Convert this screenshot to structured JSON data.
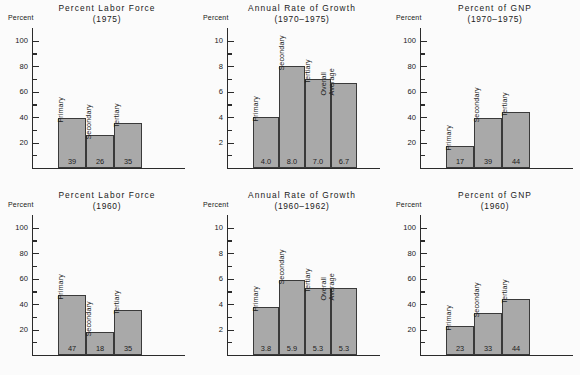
{
  "figure": {
    "background_color": "#fbfbfb",
    "bar_fill_color": "#a9a9a9",
    "bar_border_color": "#3a3a3a",
    "axis_color": "#2b2b2b"
  },
  "panels": [
    {
      "id": "labor-force-1975",
      "title": "Percent Labor Force",
      "subtitle": "(1975)",
      "axis_name": "Percent"
    },
    {
      "id": "growth-1970-1975",
      "title": "Annual Rate of Growth",
      "subtitle": "(1970–1975)",
      "axis_name": "Percent"
    },
    {
      "id": "gnp-1970-1975",
      "title": "Percent of GNP",
      "subtitle": "(1970–1975)",
      "axis_name": "Percent"
    },
    {
      "id": "labor-force-1960",
      "title": "Percent Labor Force",
      "subtitle": "(1960)",
      "axis_name": "Percent"
    },
    {
      "id": "growth-1960-1962",
      "title": "Annual Rate of Growth",
      "subtitle": "(1960–1962)",
      "axis_name": "Percent"
    },
    {
      "id": "gnp-1960",
      "title": "Percent of GNP",
      "subtitle": "(1960)",
      "axis_name": "Percent"
    }
  ],
  "chart_data": [
    {
      "type": "bar",
      "title": "Percent Labor Force",
      "subtitle": "(1975)",
      "xlabel": "",
      "ylabel": "Percent",
      "ylim": [
        0,
        110
      ],
      "yticks": [
        20,
        40,
        60,
        80,
        100
      ],
      "minor_yticks": [
        10,
        30,
        50,
        70,
        90
      ],
      "grid": false,
      "categories": [
        "Primary",
        "Secondary",
        "Tertiary"
      ],
      "values": [
        39,
        26,
        35
      ],
      "value_labels": [
        "39",
        "26",
        "35"
      ]
    },
    {
      "type": "bar",
      "title": "Annual Rate of Growth",
      "subtitle": "(1970–1975)",
      "xlabel": "",
      "ylabel": "Percent",
      "ylim": [
        0,
        11
      ],
      "yticks": [
        2,
        4,
        6,
        8,
        10
      ],
      "minor_yticks": [
        1,
        3,
        5,
        7,
        9
      ],
      "grid": false,
      "categories": [
        "Primary",
        "Secondary",
        "Tertiary",
        "Overall Average"
      ],
      "values": [
        4.0,
        8.0,
        7.0,
        6.7
      ],
      "value_labels": [
        "4.0",
        "8.0",
        "7.0",
        "6.7"
      ]
    },
    {
      "type": "bar",
      "title": "Percent of GNP",
      "subtitle": "(1970–1975)",
      "xlabel": "",
      "ylabel": "Percent",
      "ylim": [
        0,
        110
      ],
      "yticks": [
        20,
        40,
        60,
        80,
        100
      ],
      "minor_yticks": [
        10,
        30,
        50,
        70,
        90
      ],
      "grid": false,
      "categories": [
        "Primary",
        "Secondary",
        "Tertiary"
      ],
      "values": [
        17,
        39,
        44
      ],
      "value_labels": [
        "17",
        "39",
        "44"
      ]
    },
    {
      "type": "bar",
      "title": "Percent Labor Force",
      "subtitle": "(1960)",
      "xlabel": "",
      "ylabel": "Percent",
      "ylim": [
        0,
        110
      ],
      "yticks": [
        20,
        40,
        60,
        80,
        100
      ],
      "minor_yticks": [
        10,
        30,
        50,
        70,
        90
      ],
      "grid": false,
      "categories": [
        "Primary",
        "Secondary",
        "Tertiary"
      ],
      "values": [
        47,
        18,
        35
      ],
      "value_labels": [
        "47",
        "18",
        "35"
      ]
    },
    {
      "type": "bar",
      "title": "Annual Rate of Growth",
      "subtitle": "(1960–1962)",
      "xlabel": "",
      "ylabel": "Percent",
      "ylim": [
        0,
        11
      ],
      "yticks": [
        2,
        4,
        6,
        8,
        10
      ],
      "minor_yticks": [
        1,
        3,
        5,
        7,
        9
      ],
      "grid": false,
      "categories": [
        "Primary",
        "Secondary",
        "Tertiary",
        "Overall Average"
      ],
      "values": [
        3.8,
        5.9,
        5.3,
        5.3
      ],
      "value_labels": [
        "3.8",
        "5.9",
        "5.3",
        "5.3"
      ]
    },
    {
      "type": "bar",
      "title": "Percent of GNP",
      "subtitle": "(1960)",
      "xlabel": "",
      "ylabel": "Percent",
      "ylim": [
        0,
        110
      ],
      "yticks": [
        20,
        40,
        60,
        80,
        100
      ],
      "minor_yticks": [
        10,
        30,
        50,
        70,
        90
      ],
      "grid": false,
      "categories": [
        "Primary",
        "Secondary",
        "Tertiary"
      ],
      "values": [
        23,
        33,
        44
      ],
      "value_labels": [
        "23",
        "33",
        "44"
      ]
    }
  ]
}
